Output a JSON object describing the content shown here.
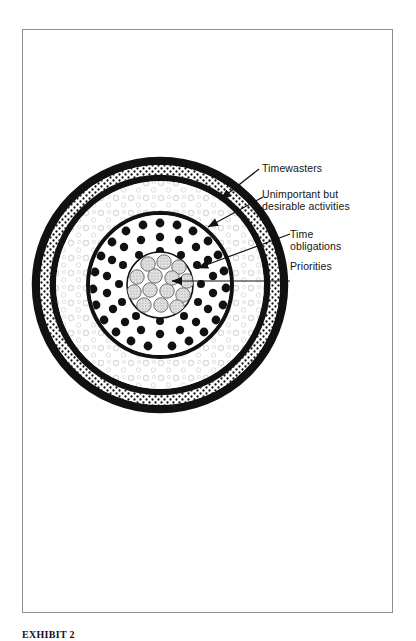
{
  "page": {
    "caption": "EXHIBIT 2",
    "background_color": "#ffffff",
    "frame_color": "#8d8d8d"
  },
  "diagram": {
    "center": {
      "x": 160,
      "y": 285
    },
    "ink_color": "#111111",
    "labels": [
      {
        "id": "timewasters",
        "text": "Timewasters",
        "target_ring": "outer-stippled-band",
        "leader": "diagonal-arrow"
      },
      {
        "id": "unimportant",
        "text": "Unimportant but\ndesirable activities",
        "target_ring": "open-circle-texture-band",
        "leader": "diagonal-arrow"
      },
      {
        "id": "time-obligations",
        "text": "Time\nobligations",
        "target_ring": "solid-dot-band",
        "leader": "horizontal-arrow"
      },
      {
        "id": "priorities",
        "text": "Priorities",
        "target_ring": "core-disc",
        "leader": "horizontal-arrow"
      }
    ],
    "rings": [
      {
        "id": "outer-black-ring",
        "label": "Outer boundary ring",
        "fill": "#111111",
        "rx": 128,
        "ry": 128
      },
      {
        "id": "outer-stippled-band",
        "label": "Timewasters",
        "fill": "#ffffff",
        "texture": "dense-stipple-dots",
        "rx": 120,
        "ry": 120
      },
      {
        "id": "middle-black-ring",
        "label": "Divider ring",
        "fill": "#111111",
        "rx": 110,
        "ry": 110
      },
      {
        "id": "open-circle-texture-band",
        "label": "Unimportant but desirable activities",
        "fill": "#ffffff",
        "texture": "light-open-circles",
        "rx": 104,
        "ry": 104
      },
      {
        "id": "inner-black-ring",
        "label": "Divider ring",
        "fill": "#111111",
        "rx": 74,
        "ry": 74
      },
      {
        "id": "solid-dot-band",
        "label": "Time obligations",
        "fill": "#ffffff",
        "texture": "solid-black-dots",
        "rx": 70,
        "ry": 70
      },
      {
        "id": "core-disc",
        "label": "Priorities",
        "fill": "#ffffff",
        "texture": "gray-stippled-circles",
        "rx": 33,
        "ry": 33
      }
    ],
    "priority_circle_count": 13,
    "priority_circle_fill": "#d8d8d8"
  }
}
